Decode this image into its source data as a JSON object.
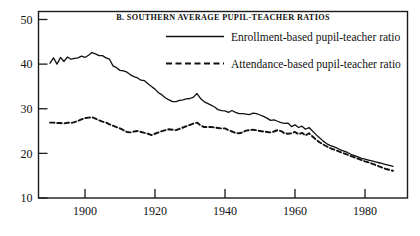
{
  "chart_data": {
    "type": "line",
    "title": "B. SOUTHERN AVERAGE PUPIL-TEACHER RATIOS",
    "xlabel": "",
    "ylabel": "",
    "xlim": [
      1889,
      1991
    ],
    "ylim": [
      9,
      51
    ],
    "grid": false,
    "legend_position": "top-right-inside",
    "xticks": [
      1900,
      1920,
      1940,
      1960,
      1980
    ],
    "xtick_labels": [
      "1900",
      "1920",
      "1940",
      "1960",
      "1980"
    ],
    "yticks": [
      10,
      20,
      30,
      40,
      50
    ],
    "ytick_labels": [
      "10",
      "20",
      "30",
      "40",
      "50"
    ],
    "series": [
      {
        "name": "Enrollment-based pupil-teacher ratio",
        "style": "solid",
        "color": "#111111",
        "x": [
          1890,
          1891,
          1892,
          1893,
          1894,
          1895,
          1896,
          1897,
          1898,
          1899,
          1900,
          1901,
          1902,
          1903,
          1904,
          1905,
          1906,
          1907,
          1908,
          1909,
          1910,
          1911,
          1912,
          1913,
          1914,
          1915,
          1916,
          1917,
          1918,
          1919,
          1920,
          1921,
          1922,
          1923,
          1924,
          1925,
          1926,
          1927,
          1928,
          1929,
          1930,
          1931,
          1932,
          1933,
          1934,
          1935,
          1936,
          1937,
          1938,
          1939,
          1940,
          1941,
          1942,
          1943,
          1944,
          1945,
          1946,
          1947,
          1948,
          1949,
          1950,
          1951,
          1952,
          1953,
          1954,
          1955,
          1956,
          1957,
          1958,
          1959,
          1960,
          1961,
          1962,
          1963,
          1964,
          1965,
          1966,
          1967,
          1968,
          1969,
          1970,
          1971,
          1972,
          1973,
          1974,
          1975,
          1976,
          1977,
          1978,
          1979,
          1980,
          1981,
          1982,
          1983,
          1984,
          1985,
          1986,
          1987,
          1988
        ],
        "values": [
          40.2,
          41.4,
          40.0,
          41.5,
          40.6,
          41.6,
          41.1,
          41.3,
          41.4,
          41.8,
          41.5,
          42.0,
          42.6,
          42.3,
          41.9,
          41.9,
          41.4,
          41.1,
          39.6,
          39.2,
          38.6,
          38.5,
          38.2,
          37.6,
          37.2,
          36.9,
          36.4,
          36.3,
          35.6,
          35.0,
          34.4,
          33.6,
          33.1,
          32.4,
          32.0,
          31.6,
          31.6,
          31.9,
          32.0,
          32.2,
          32.3,
          32.6,
          33.4,
          32.3,
          31.6,
          31.2,
          30.8,
          30.4,
          29.8,
          29.6,
          29.5,
          29.2,
          29.6,
          29.2,
          28.9,
          28.9,
          28.8,
          28.7,
          29.0,
          28.9,
          28.6,
          28.3,
          27.9,
          27.4,
          27.5,
          27.2,
          26.9,
          26.7,
          26.8,
          26.0,
          26.4,
          25.8,
          26.1,
          25.4,
          25.8,
          25.0,
          24.2,
          23.5,
          22.8,
          22.2,
          21.8,
          21.5,
          21.2,
          20.8,
          20.5,
          20.2,
          19.8,
          19.5,
          19.2,
          18.9,
          18.7,
          18.5,
          18.3,
          18.1,
          17.9,
          17.7,
          17.5,
          17.3,
          17.1
        ]
      },
      {
        "name": "Attendance-based pupil-teacher ratio",
        "style": "dashed",
        "color": "#111111",
        "x": [
          1890,
          1891,
          1892,
          1893,
          1894,
          1895,
          1896,
          1897,
          1898,
          1899,
          1900,
          1901,
          1902,
          1903,
          1904,
          1905,
          1906,
          1907,
          1908,
          1909,
          1910,
          1911,
          1912,
          1913,
          1914,
          1915,
          1916,
          1917,
          1918,
          1919,
          1920,
          1921,
          1922,
          1923,
          1924,
          1925,
          1926,
          1927,
          1928,
          1929,
          1930,
          1931,
          1932,
          1933,
          1934,
          1935,
          1936,
          1937,
          1938,
          1939,
          1940,
          1941,
          1942,
          1943,
          1944,
          1945,
          1946,
          1947,
          1948,
          1949,
          1950,
          1951,
          1952,
          1953,
          1954,
          1955,
          1956,
          1957,
          1958,
          1959,
          1960,
          1961,
          1962,
          1963,
          1964,
          1965,
          1966,
          1967,
          1968,
          1969,
          1970,
          1971,
          1972,
          1973,
          1974,
          1975,
          1976,
          1977,
          1978,
          1979,
          1980,
          1981,
          1982,
          1983,
          1984,
          1985,
          1986,
          1987,
          1988
        ],
        "values": [
          26.9,
          26.9,
          26.8,
          26.8,
          26.7,
          26.9,
          26.8,
          27.0,
          27.3,
          27.6,
          27.9,
          28.0,
          28.1,
          27.8,
          27.4,
          27.1,
          26.9,
          26.5,
          26.2,
          25.9,
          25.6,
          25.2,
          24.8,
          24.7,
          24.9,
          25.0,
          24.8,
          24.6,
          24.4,
          24.1,
          24.4,
          24.7,
          25.0,
          25.2,
          25.4,
          25.3,
          25.2,
          25.5,
          25.8,
          26.1,
          26.4,
          26.7,
          26.9,
          26.3,
          25.9,
          25.9,
          25.9,
          25.8,
          25.7,
          25.6,
          25.6,
          25.2,
          24.9,
          24.6,
          24.5,
          24.7,
          25.1,
          25.2,
          25.3,
          25.2,
          25.0,
          24.9,
          24.8,
          24.7,
          24.9,
          25.2,
          25.0,
          24.5,
          24.4,
          24.5,
          24.8,
          24.3,
          24.6,
          24.0,
          24.5,
          23.8,
          23.1,
          22.5,
          22.0,
          21.6,
          21.2,
          20.9,
          20.6,
          20.3,
          20.0,
          19.7,
          19.4,
          19.1,
          18.8,
          18.5,
          18.2,
          18.0,
          17.7,
          17.4,
          17.1,
          16.8,
          16.5,
          16.3,
          16.1
        ]
      }
    ]
  },
  "axes": {
    "left_label_top": "50",
    "left_label_bottom": "10"
  }
}
